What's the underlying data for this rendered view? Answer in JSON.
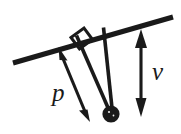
{
  "figure": {
    "type": "physics-diagram",
    "background_color": "#ffffff",
    "ink_color": "#1a1a1a",
    "canvas": {
      "width": 181,
      "height": 134
    }
  },
  "labels": {
    "p": "p",
    "v": "v"
  },
  "elements": {
    "rod": {
      "name": "inclined-rod",
      "x1": 13,
      "y1": 63,
      "x2": 173,
      "y2": 17,
      "thickness": 5
    },
    "string_left": {
      "name": "pendulum-string-left",
      "x1": 76,
      "y1": 35,
      "x2": 110,
      "y2": 110,
      "thickness": 3.4
    },
    "string_right": {
      "name": "pendulum-string-right",
      "x1": 103,
      "y1": 27,
      "x2": 112,
      "y2": 108,
      "thickness": 3.4
    },
    "bob": {
      "name": "pendulum-bob",
      "cx": 111,
      "cy": 114,
      "r": 8.5
    },
    "right_angle_marker": {
      "name": "right-angle-marker",
      "points": "72,37 84,28 92,39 80,48",
      "thickness": 3
    },
    "arrow_p": {
      "name": "arrow-p",
      "x1": 60,
      "y1": 51,
      "x2": 88,
      "y2": 118,
      "thickness": 3,
      "double_headed": true
    },
    "arrow_v": {
      "name": "arrow-v",
      "x1": 141,
      "y1": 32,
      "x2": 141,
      "y2": 112,
      "thickness": 3,
      "double_headed": true
    },
    "label_p_pos": {
      "x": 52,
      "y": 100
    },
    "label_v_pos": {
      "x": 152,
      "y": 80
    }
  }
}
